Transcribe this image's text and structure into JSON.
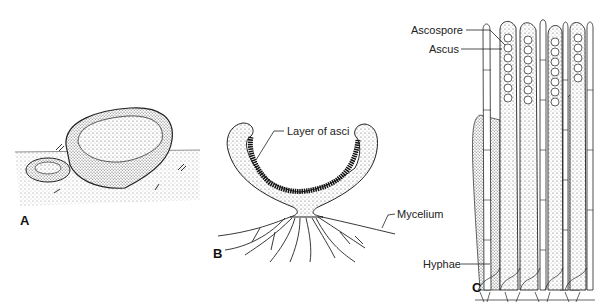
{
  "figure": {
    "panels": [
      {
        "id": "A",
        "label": "A",
        "subject": "cup fungi on ground (external view)"
      },
      {
        "id": "B",
        "label": "B",
        "subject": "section through cup-shaped ascocarp",
        "annotations": [
          "Layer of asci",
          "Mycelium"
        ]
      },
      {
        "id": "C",
        "label": "C",
        "subject": "asci and paraphyses detail",
        "annotations": [
          "Ascospore",
          "Ascus",
          "Hyphae"
        ]
      }
    ],
    "labels": {
      "panel_a": "A",
      "panel_b": "B",
      "panel_c": "C",
      "layer_of_asci": "Layer of asci",
      "mycelium": "Mycelium",
      "ascospore": "Ascospore",
      "ascus": "Ascus",
      "hyphae": "Hyphae"
    }
  }
}
